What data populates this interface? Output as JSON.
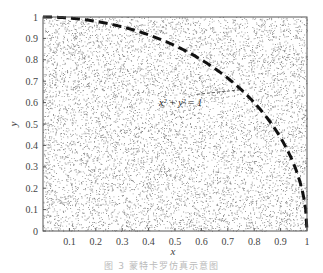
{
  "chart_data": {
    "type": "scatter",
    "title": "",
    "xlabel": "x",
    "ylabel": "y",
    "xlim": [
      0,
      1
    ],
    "ylim": [
      0,
      1
    ],
    "grid": false,
    "x_ticks": [
      "0.1",
      "0.2",
      "0.3",
      "0.4",
      "0.5",
      "0.6",
      "0.7",
      "0.8",
      "0.9",
      "1"
    ],
    "y_ticks": [
      "0",
      "0.1",
      "0.2",
      "0.3",
      "0.4",
      "0.5",
      "0.6",
      "0.7",
      "0.8",
      "0.9",
      "1"
    ],
    "series": [
      {
        "name": "random points",
        "kind": "scatter",
        "description": "uniformly distributed random points in unit square",
        "count": 9000,
        "color": "#8a8a8a"
      },
      {
        "name": "x^2 + y^2 = 1",
        "kind": "line",
        "style": "dashed",
        "color": "#111111",
        "equation": "y = sqrt(1 - x^2)",
        "x_range": [
          0,
          1
        ]
      }
    ],
    "annotations": [
      {
        "text": "x² + y² = 1",
        "x": 0.5,
        "y": 0.62,
        "points_to": [
          0.75,
          0.66
        ]
      }
    ]
  },
  "caption": "图 3   蒙特卡罗仿真示意图"
}
